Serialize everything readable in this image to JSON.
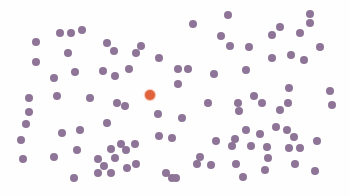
{
  "colors": {
    "background": "#fefefe",
    "dot": "#8e7496",
    "target_dot": "#e0633d"
  },
  "target": {
    "x": 150,
    "y": 95,
    "color": "orange"
  },
  "dots": [
    [
      36,
      42
    ],
    [
      60,
      33
    ],
    [
      71,
      33
    ],
    [
      82,
      30
    ],
    [
      36,
      62
    ],
    [
      68,
      53
    ],
    [
      107,
      43
    ],
    [
      114,
      51
    ],
    [
      136,
      53
    ],
    [
      141,
      46
    ],
    [
      159,
      58
    ],
    [
      54,
      78
    ],
    [
      75,
      72
    ],
    [
      103,
      71
    ],
    [
      115,
      76
    ],
    [
      129,
      69
    ],
    [
      29,
      98
    ],
    [
      57,
      96
    ],
    [
      90,
      98
    ],
    [
      228,
      15
    ],
    [
      193,
      24
    ],
    [
      221,
      36
    ],
    [
      230,
      46
    ],
    [
      249,
      47
    ],
    [
      272,
      35
    ],
    [
      280,
      27
    ],
    [
      300,
      33
    ],
    [
      310,
      23
    ],
    [
      310,
      14
    ],
    [
      320,
      47
    ],
    [
      272,
      58
    ],
    [
      291,
      55
    ],
    [
      304,
      60
    ],
    [
      178,
      69
    ],
    [
      188,
      69
    ],
    [
      214,
      74
    ],
    [
      246,
      70
    ],
    [
      178,
      84
    ],
    [
      254,
      96
    ],
    [
      289,
      88
    ],
    [
      330,
      91
    ],
    [
      29,
      112
    ],
    [
      26,
      124
    ],
    [
      21,
      140
    ],
    [
      23,
      159
    ],
    [
      62,
      133
    ],
    [
      80,
      130
    ],
    [
      77,
      150
    ],
    [
      54,
      157
    ],
    [
      107,
      123
    ],
    [
      117,
      103
    ],
    [
      125,
      106
    ],
    [
      158,
      114
    ],
    [
      159,
      136
    ],
    [
      172,
      138
    ],
    [
      111,
      149
    ],
    [
      121,
      144
    ],
    [
      126,
      150
    ],
    [
      135,
      144
    ],
    [
      115,
      158
    ],
    [
      98,
      159
    ],
    [
      104,
      166
    ],
    [
      74,
      178
    ],
    [
      98,
      173
    ],
    [
      111,
      173
    ],
    [
      127,
      168
    ],
    [
      136,
      164
    ],
    [
      166,
      173
    ],
    [
      172,
      178
    ],
    [
      208,
      103
    ],
    [
      238,
      103
    ],
    [
      262,
      103
    ],
    [
      288,
      103
    ],
    [
      332,
      105
    ],
    [
      182,
      118
    ],
    [
      239,
      111
    ],
    [
      280,
      110
    ],
    [
      246,
      130
    ],
    [
      260,
      134
    ],
    [
      276,
      127
    ],
    [
      287,
      130
    ],
    [
      294,
      137
    ],
    [
      216,
      141
    ],
    [
      235,
      139
    ],
    [
      232,
      146
    ],
    [
      251,
      146
    ],
    [
      267,
      147
    ],
    [
      289,
      148
    ],
    [
      300,
      148
    ],
    [
      317,
      141
    ],
    [
      268,
      158
    ],
    [
      200,
      157
    ],
    [
      211,
      165
    ],
    [
      197,
      164
    ],
    [
      236,
      164
    ],
    [
      265,
      170
    ],
    [
      295,
      164
    ],
    [
      315,
      171
    ],
    [
      243,
      177
    ],
    [
      176,
      178
    ]
  ]
}
